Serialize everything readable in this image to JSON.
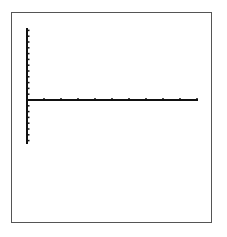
{
  "chart_data": {
    "type": "line",
    "title": "",
    "xlabel": "",
    "ylabel": "",
    "series": [],
    "xlim": [
      0,
      10
    ],
    "ylim": [
      -7.5,
      12.5
    ],
    "x_ticks": [
      1,
      2,
      3,
      4,
      5,
      6,
      7,
      8,
      9,
      10
    ],
    "y_ticks_above": 12,
    "y_ticks_below": 7,
    "grid": false,
    "legend": "none",
    "axis_color": "#111111",
    "frame_color": "#555555"
  },
  "layout": {
    "origin_x": 27,
    "origin_y": 100,
    "x_end": 198,
    "y_top": 28,
    "y_bottom": 144,
    "x_tick_spacing": 17,
    "y_tick_spacing": 5.8
  }
}
